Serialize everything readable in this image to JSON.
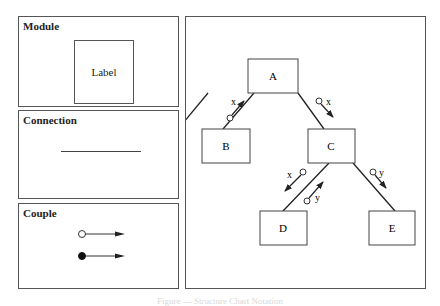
{
  "legend": {
    "module": {
      "title": "Module",
      "example_label": "Label"
    },
    "connection": {
      "title": "Connection"
    },
    "couple": {
      "title": "Couple",
      "items": [
        {
          "symbol": "open-circle-arrow",
          "meaning": "data couple"
        },
        {
          "symbol": "filled-circle-arrow",
          "meaning": "control couple"
        }
      ]
    }
  },
  "diagram": {
    "modules": [
      {
        "id": "A",
        "label": "A"
      },
      {
        "id": "B",
        "label": "B"
      },
      {
        "id": "C",
        "label": "C"
      },
      {
        "id": "D",
        "label": "D"
      },
      {
        "id": "E",
        "label": "E"
      }
    ],
    "connections": [
      {
        "from": "A",
        "to": "B",
        "couples": [
          {
            "label": "x",
            "direction": "B->A",
            "type": "data"
          }
        ]
      },
      {
        "from": "A",
        "to": "C",
        "couples": [
          {
            "label": "x",
            "direction": "A->C",
            "type": "data"
          }
        ]
      },
      {
        "from": "C",
        "to": "D",
        "couples": [
          {
            "label": "x",
            "direction": "C->D",
            "type": "data"
          },
          {
            "label": "y",
            "direction": "D->C",
            "type": "data"
          }
        ]
      },
      {
        "from": "C",
        "to": "E",
        "couples": [
          {
            "label": "y",
            "direction": "C->E",
            "type": "data"
          }
        ]
      }
    ],
    "couple_labels": {
      "ab": "x",
      "ac": "x",
      "cd_down": "x",
      "cd_up": "y",
      "ce": "y"
    }
  },
  "caption": "Figure — Structure Chart Notation"
}
